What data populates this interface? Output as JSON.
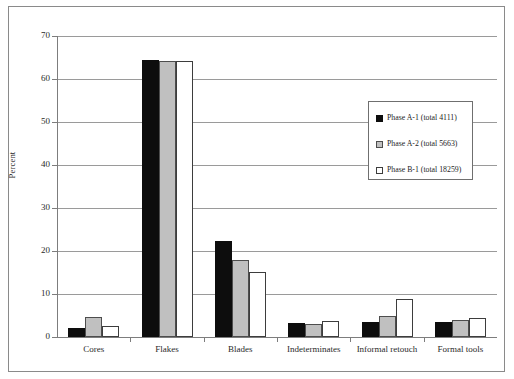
{
  "chart_data": {
    "type": "bar",
    "title": "",
    "subtitle": "",
    "xlabel": "",
    "ylabel": "Percent",
    "ylim": [
      0,
      70
    ],
    "yticks": [
      0,
      10,
      20,
      30,
      40,
      50,
      60,
      70
    ],
    "ytick_labels": [
      "0",
      "10",
      "20",
      "30",
      "40",
      "50",
      "60",
      "70"
    ],
    "grid": "horizontal",
    "legend_position": "center-right",
    "categories": [
      "Cores",
      "Flakes",
      "Blades",
      "Indeterminates",
      "Informal retouch",
      "Formal tools"
    ],
    "series": [
      {
        "name": "Phase A-1 (total 4111)",
        "color": "#0d0d0d",
        "values": [
          2.2,
          64.4,
          22.3,
          3.2,
          3.4,
          3.6
        ]
      },
      {
        "name": "Phase A-2 (total 5663)",
        "color": "#c0c0c0",
        "values": [
          4.7,
          64.3,
          17.8,
          3.0,
          4.9,
          4.0
        ]
      },
      {
        "name": "Phase B-1 (total 18259)",
        "color": "#ffffff",
        "values": [
          2.5,
          64.2,
          15.1,
          3.8,
          8.9,
          4.5
        ]
      }
    ]
  },
  "legend": {
    "items": [
      {
        "label": "Phase A-1 (total 4111)",
        "swatch": "black-square-icon"
      },
      {
        "label": "Phase A-2 (total 5663)",
        "swatch": "gray-square-icon"
      },
      {
        "label": "Phase B-1 (total 18259)",
        "swatch": "white-square-icon"
      }
    ]
  }
}
